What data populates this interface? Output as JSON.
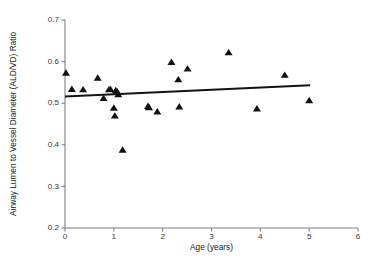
{
  "chart_data": {
    "type": "scatter",
    "title": "",
    "xlabel": "Age (years)",
    "ylabel": "Airway Lumen to Vessel Diameter (ALD/VD) Ratio",
    "xlim": [
      0,
      6
    ],
    "ylim": [
      0.2,
      0.7
    ],
    "xticks": [
      "0",
      "1",
      "2",
      "3",
      "4",
      "5",
      "6"
    ],
    "xtick_values": [
      0,
      1,
      2,
      3,
      4,
      5,
      6
    ],
    "yticks": [
      "0.2",
      "0.3",
      "0.4",
      "0.5",
      "0.6",
      "0.7"
    ],
    "ytick_values": [
      0.2,
      0.3,
      0.4,
      0.5,
      0.6,
      0.7
    ],
    "grid": false,
    "legend": "none",
    "marker_shape": "triangle-up",
    "marker_color": "#111111",
    "axis_color": "#808080",
    "trendline_color": "#141414",
    "points": [
      {
        "x": 0.02,
        "y": 0.573
      },
      {
        "x": 0.14,
        "y": 0.534
      },
      {
        "x": 0.37,
        "y": 0.533
      },
      {
        "x": 0.67,
        "y": 0.561
      },
      {
        "x": 0.79,
        "y": 0.512
      },
      {
        "x": 0.9,
        "y": 0.533
      },
      {
        "x": 0.93,
        "y": 0.534
      },
      {
        "x": 1.0,
        "y": 0.489
      },
      {
        "x": 1.02,
        "y": 0.47
      },
      {
        "x": 1.04,
        "y": 0.531
      },
      {
        "x": 1.07,
        "y": 0.528
      },
      {
        "x": 1.09,
        "y": 0.521
      },
      {
        "x": 1.18,
        "y": 0.388
      },
      {
        "x": 1.7,
        "y": 0.493
      },
      {
        "x": 1.72,
        "y": 0.49
      },
      {
        "x": 1.89,
        "y": 0.48
      },
      {
        "x": 2.18,
        "y": 0.599
      },
      {
        "x": 2.32,
        "y": 0.557
      },
      {
        "x": 2.34,
        "y": 0.492
      },
      {
        "x": 2.51,
        "y": 0.583
      },
      {
        "x": 3.35,
        "y": 0.622
      },
      {
        "x": 3.93,
        "y": 0.487
      },
      {
        "x": 4.5,
        "y": 0.568
      },
      {
        "x": 5.0,
        "y": 0.507
      }
    ],
    "trendline": {
      "type": "linear-fit",
      "x_start": 0.0,
      "y_start": 0.516,
      "x_end": 5.02,
      "y_end": 0.543
    }
  }
}
